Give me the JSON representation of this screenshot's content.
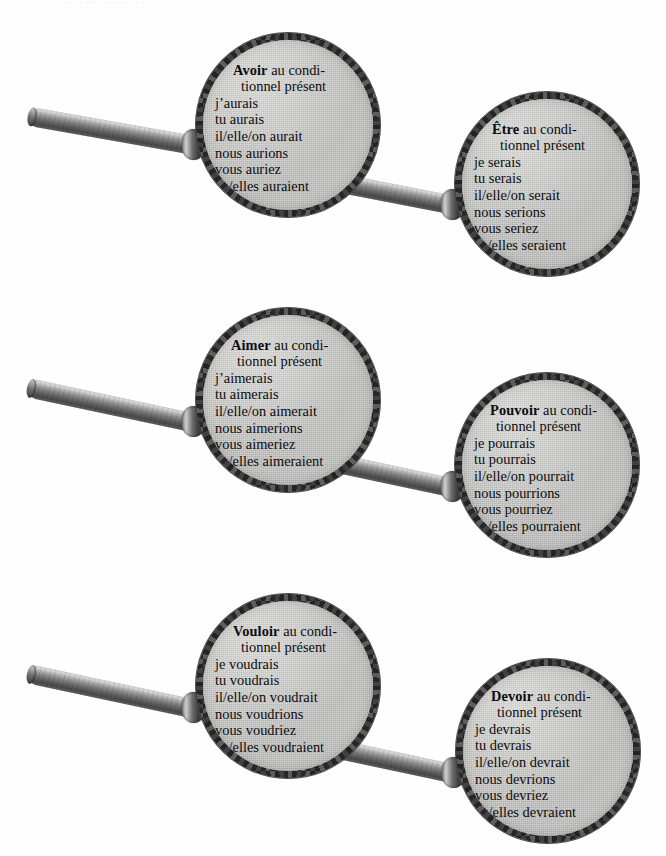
{
  "page": {
    "header_remnant": "··· ·· ···· ·· ···· ·· ··",
    "tense_label": "au conditionnel présent",
    "ink_color": "#111111",
    "glass_color": "#c9c9c7",
    "rim_color": "#2e2e2e",
    "handle_color": "#6f6f6f"
  },
  "magnifiers": [
    {
      "id": "avoir",
      "verb": "Avoir",
      "tense_part1": " au condi-",
      "tense_part2": "tionnel présent",
      "forms": [
        "j’aurais",
        "tu aurais",
        "il/elle/on aurait",
        "nous aurions",
        "vous auriez",
        "ils/elles auraient"
      ]
    },
    {
      "id": "etre",
      "verb": "Être",
      "tense_part1": " au condi-",
      "tense_part2": "tionnel présent",
      "forms": [
        "je serais",
        "tu serais",
        "il/elle/on serait",
        "nous serions",
        "vous seriez",
        "ils/elles seraient"
      ]
    },
    {
      "id": "aimer",
      "verb": "Aimer",
      "tense_part1": " au condi-",
      "tense_part2": "tionnel présent",
      "forms": [
        "j’aimerais",
        "tu aimerais",
        "il/elle/on aimerait",
        "nous aimerions",
        "vous aimeriez",
        "ils/elles aimeraient"
      ]
    },
    {
      "id": "pouvoir",
      "verb": "Pouvoir",
      "tense_part1": " au condi-",
      "tense_part2": "tionnel présent",
      "forms": [
        "je pourrais",
        "tu pourrais",
        "il/elle/on pourrait",
        "nous pourrions",
        "vous pourriez",
        "ils/elles pourraient"
      ]
    },
    {
      "id": "vouloir",
      "verb": "Vouloir",
      "tense_part1": " au condi-",
      "tense_part2": "tionnel présent",
      "forms": [
        "je voudrais",
        "tu voudrais",
        "il/elle/on voudrait",
        "nous voudrions",
        "vous voudriez",
        "ils/elles voudraient"
      ]
    },
    {
      "id": "devoir",
      "verb": "Devoir",
      "tense_part1": " au condi-",
      "tense_part2": "tionnel présent",
      "forms": [
        "je devrais",
        "tu devrais",
        "il/elle/on devrait",
        "nous devrions",
        "vous devriez",
        "ils/elles devraient"
      ]
    }
  ]
}
